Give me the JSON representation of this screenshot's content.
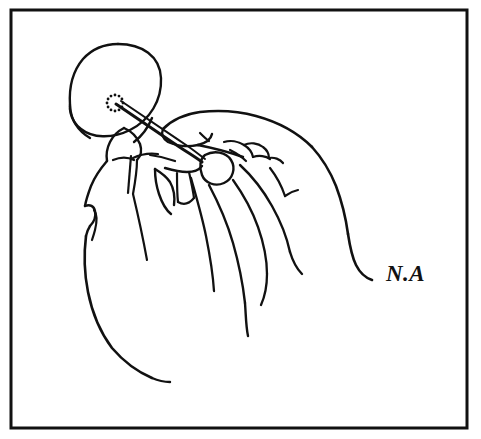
{
  "artwork": {
    "title": "Hands holding a dandelion seed head",
    "medium": "pen and ink line drawing",
    "style": "black outline on white background",
    "background_color": "#ffffff",
    "ink_color": "#111111",
    "canvas": {
      "width": 481,
      "height": 439
    }
  },
  "frame": {
    "name": "rectangular border",
    "stroke_color": "#111111",
    "stroke_width": 3,
    "x": 11,
    "y": 10,
    "width": 456,
    "height": 418
  },
  "subjects": {
    "puffball": {
      "label": "dandelion seed head",
      "center_x": 117,
      "center_y": 89,
      "radius": 45,
      "stroke_color": "#111111"
    },
    "receptacle_dots": {
      "label": "ring of dots at stem attachment",
      "center_x": 115,
      "center_y": 103,
      "radius": 8,
      "dot_count": 12,
      "dot_radius": 1.4
    },
    "stem": {
      "label": "dandelion stem",
      "from_x": 118,
      "from_y": 106,
      "to_x": 200,
      "to_y": 163
    },
    "left_hand": {
      "label": "left hand, thumb and index finger pinching the stem"
    },
    "right_hand": {
      "label": "right hand, fingers curled holding the stem"
    }
  },
  "signature": {
    "name": "artist initials",
    "text": "N.A",
    "x": 386,
    "y": 281,
    "color": "#111111"
  }
}
